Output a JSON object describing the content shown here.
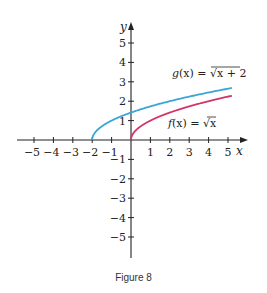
{
  "figure": {
    "caption": "Figure 8"
  },
  "chart_data": {
    "type": "line",
    "title": "",
    "xlabel": "x",
    "ylabel": "y",
    "xlim": [
      -5,
      5
    ],
    "ylim": [
      -5,
      5
    ],
    "x_ticks": [
      -5,
      -4,
      -3,
      -2,
      -1,
      1,
      2,
      3,
      4,
      5
    ],
    "y_ticks": [
      -5,
      -4,
      -3,
      -2,
      -1,
      1,
      2,
      3,
      4,
      5
    ],
    "grid": false,
    "series": [
      {
        "name": "g(x) = √(x + 2)",
        "color": "#3aa6d6",
        "domain": [
          -2,
          5.2
        ],
        "x": [
          -2,
          -1.5,
          -1,
          0,
          1,
          2,
          3,
          4,
          5
        ],
        "y": [
          0,
          0.71,
          1,
          1.41,
          1.73,
          2,
          2.24,
          2.45,
          2.65
        ],
        "label_parts": {
          "func": "g",
          "arg": "(x)",
          "eq": " = ",
          "radicand": "x + 2"
        }
      },
      {
        "name": "f(x) = √x",
        "color": "#d3356a",
        "domain": [
          0,
          5.2
        ],
        "x": [
          0,
          0.25,
          1,
          2,
          3,
          4,
          5
        ],
        "y": [
          0,
          0.5,
          1,
          1.41,
          1.73,
          2,
          2.24
        ],
        "label_parts": {
          "func": "f",
          "arg": "(x)",
          "eq": " = ",
          "radicand": "x"
        }
      }
    ]
  },
  "labels": {
    "x_axis": "x",
    "y_axis": "y",
    "g_label": "g(x) = √x + 2",
    "f_label": "f(x) = √x"
  }
}
